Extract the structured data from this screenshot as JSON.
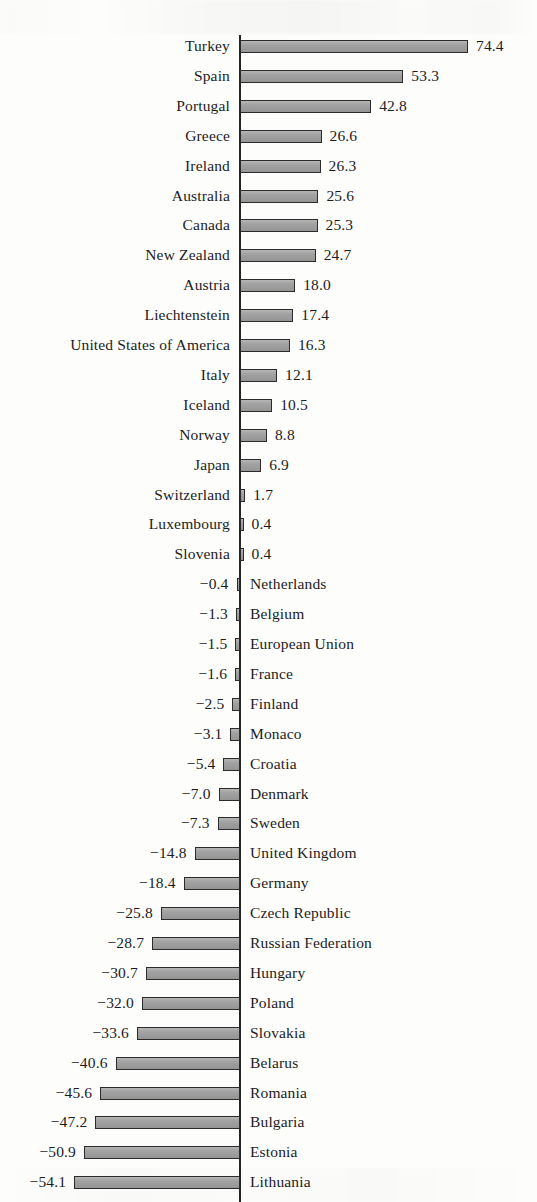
{
  "figure": {
    "kind": "diverging-horizontal-bar-chart",
    "axis_color": "#242424",
    "bar_fill": "#9d9d9d",
    "bar_stroke": "#2b2b2b",
    "background": "#fdfdfc"
  },
  "chart_data": {
    "type": "bar",
    "orientation": "horizontal",
    "title": "",
    "subtitle": "",
    "xlabel": "",
    "ylabel": "",
    "grid": false,
    "legend": null,
    "legend_position": "none",
    "zero_reference_line": true,
    "sorted": "descending",
    "xlim": [
      -58.9,
      74.4
    ],
    "categories": [
      "Turkey",
      "Spain",
      "Portugal",
      "Greece",
      "Ireland",
      "Australia",
      "Canada",
      "New Zealand",
      "Austria",
      "Liechtenstein",
      "United States of America",
      "Italy",
      "Iceland",
      "Norway",
      "Japan",
      "Switzerland",
      "Luxembourg",
      "Slovenia",
      "Netherlands",
      "Belgium",
      "European Union",
      "France",
      "Finland",
      "Monaco",
      "Croatia",
      "Denmark",
      "Sweden",
      "United Kingdom",
      "Germany",
      "Czech Republic",
      "Russian Federation",
      "Hungary",
      "Poland",
      "Slovakia",
      "Belarus",
      "Romania",
      "Bulgaria",
      "Estonia",
      "Lithuania",
      "Ukraine",
      "Latvia"
    ],
    "values": [
      74.4,
      53.3,
      42.8,
      26.6,
      26.3,
      25.6,
      25.3,
      24.7,
      18.0,
      17.4,
      16.3,
      12.1,
      10.5,
      8.8,
      6.9,
      1.7,
      0.4,
      0.4,
      -0.4,
      -1.3,
      -1.5,
      -1.6,
      -2.5,
      -3.1,
      -5.4,
      -7.0,
      -7.3,
      -14.8,
      -18.4,
      -25.8,
      -28.7,
      -30.7,
      -32.0,
      -33.6,
      -40.6,
      -45.6,
      -47.2,
      -50.9,
      -54.1,
      -54.7,
      -58.9
    ],
    "value_labels": [
      "74.4",
      "53.3",
      "42.8",
      "26.6",
      "26.3",
      "25.6",
      "25.3",
      "24.7",
      "18.0",
      "17.4",
      "16.3",
      "12.1",
      "10.5",
      "8.8",
      "6.9",
      "1.7",
      "0.4",
      "0.4",
      "−0.4",
      "−1.3",
      "−1.5",
      "−1.6",
      "−2.5",
      "−3.1",
      "−5.4",
      "−7.0",
      "−7.3",
      "−14.8",
      "−18.4",
      "−25.8",
      "−28.7",
      "−30.7",
      "−32.0",
      "−33.6",
      "−40.6",
      "−45.6",
      "−47.2",
      "−50.9",
      "−54.1",
      "−54.7",
      "−58.9"
    ]
  }
}
